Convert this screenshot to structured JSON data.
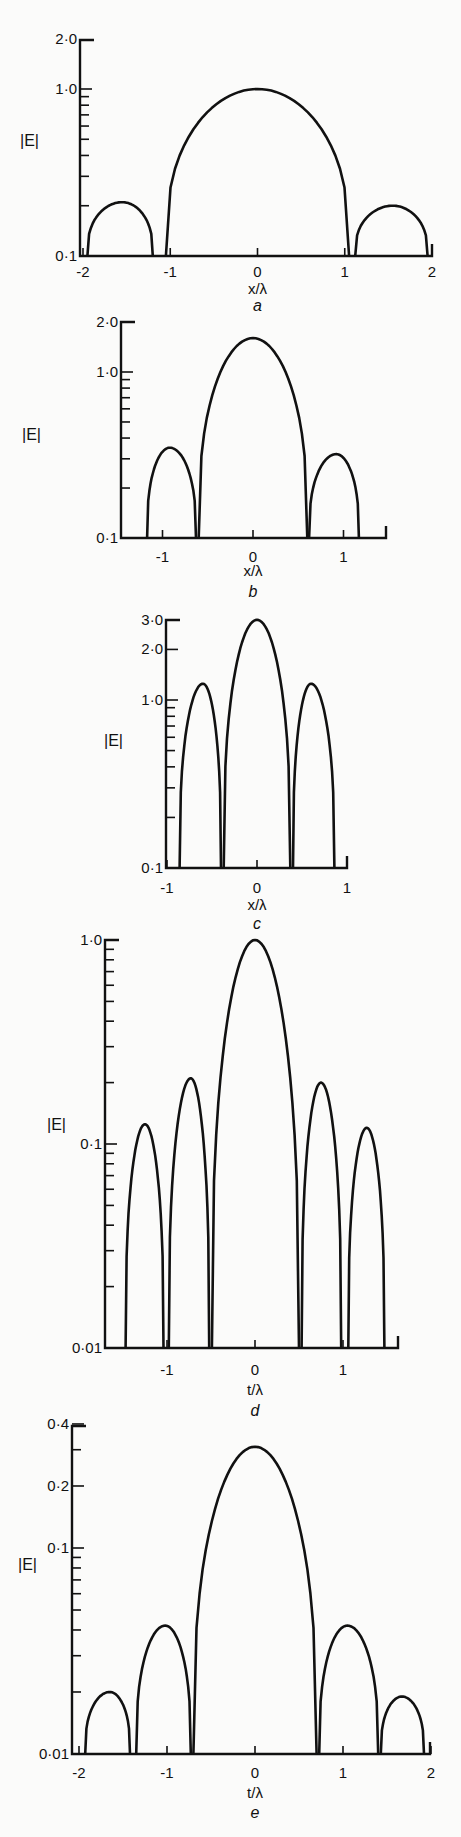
{
  "chart_data": [
    {
      "id": "a",
      "type": "line",
      "caption": "a",
      "xlabel": "x/λ",
      "ylabel": "|E|",
      "yscale": "log",
      "ylim": [
        0.1,
        2.0
      ],
      "xlim": [
        -2,
        2
      ],
      "xticks": [
        -2,
        -1,
        0,
        1,
        2
      ],
      "xtick_labels": [
        "-2",
        "-1",
        "0",
        "1",
        "2"
      ],
      "ytick_labels": [
        {
          "v": 2.0,
          "t": "2·0"
        },
        {
          "v": 1.0,
          "t": "1·0"
        },
        {
          "v": 0.1,
          "t": "0·1"
        }
      ],
      "minor_yticks": [
        0.9,
        0.8,
        0.7,
        0.6,
        0.5,
        0.4,
        0.3,
        0.2
      ],
      "lobes": [
        {
          "start": -1.95,
          "end": -1.2,
          "peak_x": -1.55,
          "peak": 0.21
        },
        {
          "start": -1.05,
          "end": 1.05,
          "peak_x": 0,
          "peak": 1.0
        },
        {
          "start": 1.12,
          "end": 1.95,
          "peak_x": 1.55,
          "peak": 0.2
        }
      ],
      "frame": {
        "x0": 80,
        "x1": 432,
        "xmin_px": 83,
        "xmax_px": 432,
        "ytop": 40,
        "ybase": 256,
        "ydecade": 167,
        "yref": 1.0,
        "yref_px": 89,
        "label_y": 272,
        "xlabel_y": 294,
        "cap_y": 311,
        "ylab_x": 20,
        "ylab_y": 146
      }
    },
    {
      "id": "b",
      "type": "line",
      "caption": "b",
      "xlabel": "x/λ",
      "ylabel": "|E|",
      "yscale": "log",
      "ylim": [
        0.1,
        2.0
      ],
      "xlim": [
        -1.4,
        1.47
      ],
      "xticks": [
        -1,
        0,
        1
      ],
      "xtick_labels": [
        "-1",
        "0",
        "1"
      ],
      "ytick_labels": [
        {
          "v": 2.0,
          "t": "2·0"
        },
        {
          "v": 1.0,
          "t": "1·0"
        },
        {
          "v": 0.1,
          "t": "0·1"
        }
      ],
      "minor_yticks": [
        0.9,
        0.8,
        0.7,
        0.6,
        0.5,
        0.4,
        0.3,
        0.2
      ],
      "lobes": [
        {
          "start": -1.17,
          "end": -0.63,
          "peak_x": -0.92,
          "peak": 0.35
        },
        {
          "start": -0.6,
          "end": 0.6,
          "peak_x": 0,
          "peak": 1.6
        },
        {
          "start": 0.62,
          "end": 1.17,
          "peak_x": 0.92,
          "peak": 0.32
        }
      ],
      "frame": {
        "x0": 121,
        "x1": 386,
        "xzero_px": 253,
        "xunit_px": 90.5,
        "ytop": 322,
        "ybase": 538,
        "ydecade": 166,
        "yref": 1.0,
        "yref_px": 372,
        "label_y": 557,
        "xlabel_y": 576,
        "cap_y": 597,
        "ylab_x": 22,
        "ylab_y": 440
      }
    },
    {
      "id": "c",
      "type": "line",
      "caption": "c",
      "xlabel": "x/λ",
      "ylabel": "|E|",
      "yscale": "log",
      "ylim": [
        0.1,
        3.0
      ],
      "xlim": [
        -1,
        1
      ],
      "xticks": [
        -1,
        0,
        1
      ],
      "xtick_labels": [
        "-1",
        "0",
        "1"
      ],
      "ytick_labels": [
        {
          "v": 3.0,
          "t": "3·0"
        },
        {
          "v": 2.0,
          "t": "2·0"
        },
        {
          "v": 1.0,
          "t": "1·0"
        },
        {
          "v": 0.1,
          "t": "0·1"
        }
      ],
      "minor_yticks": [
        0.9,
        0.8,
        0.7,
        0.6,
        0.5,
        0.4,
        0.3,
        0.2
      ],
      "lobes": [
        {
          "start": -0.86,
          "end": -0.4,
          "peak_x": -0.6,
          "peak": 1.25
        },
        {
          "start": -0.37,
          "end": 0.37,
          "peak_x": 0,
          "peak": 3.0
        },
        {
          "start": 0.4,
          "end": 0.86,
          "peak_x": 0.6,
          "peak": 1.25
        }
      ],
      "frame": {
        "x0": 166,
        "x1": 347,
        "xzero_px": 257,
        "xunit_px": 90,
        "ytop": 620,
        "ybase": 868,
        "ydecade": 168,
        "yref": 1.0,
        "yref_px": 700,
        "label_y": 888,
        "xlabel_y": 910,
        "cap_y": 929,
        "ylab_x": 104,
        "ylab_y": 746
      }
    },
    {
      "id": "d",
      "type": "line",
      "caption": "d",
      "xlabel": "t/λ",
      "ylabel": "|E|",
      "yscale": "log",
      "ylim": [
        0.01,
        1.0
      ],
      "xlim": [
        -1.7,
        1.6
      ],
      "xticks": [
        -1,
        0,
        1
      ],
      "xtick_labels": [
        "-1",
        "0",
        "1"
      ],
      "ytick_labels": [
        {
          "v": 1.0,
          "t": "1·0"
        },
        {
          "v": 0.1,
          "t": "0·1"
        },
        {
          "v": 0.01,
          "t": "0·01"
        }
      ],
      "minor_yticks": [
        0.9,
        0.8,
        0.7,
        0.6,
        0.5,
        0.4,
        0.3,
        0.2,
        0.09,
        0.08,
        0.07,
        0.06,
        0.05,
        0.04,
        0.03,
        0.02
      ],
      "lobes": [
        {
          "start": -1.47,
          "end": -1.04,
          "peak_x": -1.25,
          "peak": 0.125
        },
        {
          "start": -0.98,
          "end": -0.52,
          "peak_x": -0.73,
          "peak": 0.21
        },
        {
          "start": -0.49,
          "end": 0.5,
          "peak_x": 0,
          "peak": 1.0
        },
        {
          "start": 0.53,
          "end": 0.98,
          "peak_x": 0.75,
          "peak": 0.2
        },
        {
          "start": 1.06,
          "end": 1.47,
          "peak_x": 1.27,
          "peak": 0.12
        }
      ],
      "frame": {
        "x0": 105,
        "x1": 398,
        "xzero_px": 255,
        "xunit_px": 88,
        "ytop": 940,
        "ybase": 1348,
        "ydecade": 204,
        "yref": 1.0,
        "yref_px": 940,
        "label_y": 1370,
        "xlabel_y": 1395,
        "cap_y": 1416,
        "ylab_x": 47,
        "ylab_y": 1130
      }
    },
    {
      "id": "e",
      "type": "line",
      "caption": "e",
      "xlabel": "t/λ",
      "ylabel": "|E|",
      "yscale": "log",
      "ylim": [
        0.01,
        0.4
      ],
      "xlim": [
        -2,
        2
      ],
      "xticks": [
        -2,
        -1,
        0,
        1,
        2
      ],
      "xtick_labels": [
        "-2",
        "-1",
        "0",
        "1",
        "2"
      ],
      "ytick_labels": [
        {
          "v": 0.4,
          "t": "0·4"
        },
        {
          "v": 0.2,
          "t": "0·2"
        },
        {
          "v": 0.1,
          "t": "0·1"
        },
        {
          "v": 0.01,
          "t": "0·01"
        }
      ],
      "minor_yticks": [
        0.3,
        0.09,
        0.08,
        0.07,
        0.06,
        0.05,
        0.04,
        0.03,
        0.02
      ],
      "lobes": [
        {
          "start": -1.93,
          "end": -1.42,
          "peak_x": -1.65,
          "peak": 0.02
        },
        {
          "start": -1.35,
          "end": -0.73,
          "peak_x": -1.02,
          "peak": 0.042
        },
        {
          "start": -0.7,
          "end": 0.7,
          "peak_x": 0,
          "peak": 0.31
        },
        {
          "start": 0.73,
          "end": 1.4,
          "peak_x": 1.05,
          "peak": 0.042
        },
        {
          "start": 1.43,
          "end": 1.92,
          "peak_x": 1.67,
          "peak": 0.019
        }
      ],
      "frame": {
        "x0": 72,
        "x1": 430,
        "xzero_px": 255,
        "xunit_px": 88,
        "ytop": 1426,
        "ybase": 1754,
        "ydecade": 206,
        "yref": 0.1,
        "yref_px": 1548,
        "label_y": 1773,
        "xlabel_y": 1798,
        "cap_y": 1818,
        "ylab_x": 18,
        "ylab_y": 1570
      }
    }
  ]
}
